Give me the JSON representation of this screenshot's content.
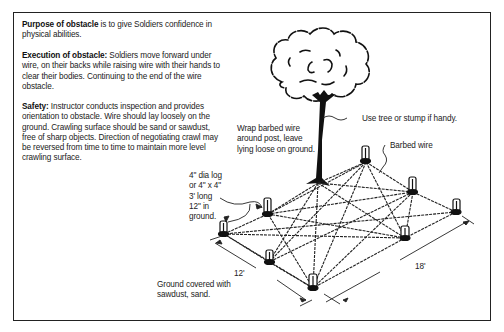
{
  "figure": {
    "sections": [
      {
        "heading": "Purpose of obstacle",
        "text": " is to give Soldiers confidence in physical abilities."
      },
      {
        "heading": "Execution of obstacle:",
        "text": "  Soldiers move forward under wire, on their backs while raising wire with their hands to clear their bodies.  Continuing to the end of the wire obstacle."
      },
      {
        "heading": "Safety:",
        "text": "  Instructor conducts inspection and provides orientation to obstacle.  Wire should lay loosely on the ground.  Crawling surface should be sand or sawdust, free of sharp objects.  Direction of negotiating crawl may be reversed from time to time to maintain more level crawling surface."
      }
    ],
    "callouts": {
      "tree": "Use tree or stump if handy.",
      "barbed_wire": "Barbed wire",
      "wrap": [
        "Wrap barbed wire",
        "around post, leave",
        "lying loose on ground."
      ],
      "post": [
        "4\" dia log",
        "or 4\" x 4\"",
        "3' long",
        "12\" in",
        "ground."
      ],
      "ground": [
        "Ground covered with",
        "sawdust, sand."
      ]
    },
    "dimensions": {
      "width": "12'",
      "length": "18'"
    }
  }
}
